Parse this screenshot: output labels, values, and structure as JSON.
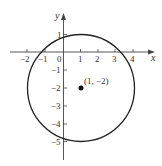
{
  "diagram": {
    "type": "circle-on-coordinate-plane",
    "axes": {
      "x_label": "x",
      "y_label": "y",
      "x_ticks": [
        "−2",
        "−1",
        "0",
        "1",
        "2",
        "3",
        "4"
      ],
      "y_ticks": [
        "1",
        "−1",
        "−2",
        "−3",
        "−4",
        "−5"
      ]
    },
    "circle": {
      "center": [
        1,
        -2
      ],
      "radius": 3
    },
    "center_label": "(1, −2)"
  }
}
